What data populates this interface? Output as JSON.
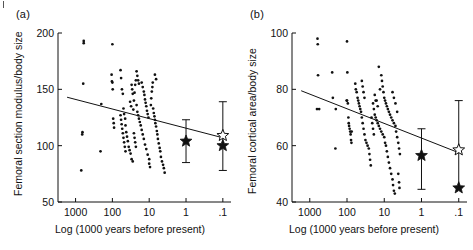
{
  "figure": {
    "corner_mark": "crop-tick-mark",
    "background": "#ffffff",
    "ink": "#111111"
  },
  "chart_data": [
    {
      "panel": "(a)",
      "type": "scatter",
      "title": "",
      "xlabel": "Log (1000 years before present)",
      "ylabel": "Femoral section modulus/body size",
      "x_scale": "log-reversed",
      "x_ticklabels": [
        "1000",
        "100",
        "10",
        "1",
        ".1"
      ],
      "x_tickvalues": [
        1000,
        100,
        10,
        1,
        0.1
      ],
      "xlim": [
        3000,
        0.06
      ],
      "y_ticklabels": [
        "50",
        "100",
        "150",
        "200"
      ],
      "y_tickvalues": [
        50,
        100,
        150,
        200
      ],
      "ylim": [
        50,
        200
      ],
      "grid": false,
      "legend": "none",
      "regression_line": {
        "x_start": 1700,
        "y_start": 143,
        "x_end": 0.1,
        "y_end": 107
      },
      "points": [
        [
          600,
          193
        ],
        [
          600,
          191
        ],
        [
          620,
          155
        ],
        [
          650,
          112
        ],
        [
          660,
          110
        ],
        [
          700,
          78
        ],
        [
          200,
          137
        ],
        [
          210,
          95
        ],
        [
          100,
          190
        ],
        [
          105,
          163
        ],
        [
          103,
          157
        ],
        [
          100,
          156
        ],
        [
          98,
          150
        ],
        [
          95,
          124
        ],
        [
          92,
          120
        ],
        [
          90,
          116
        ],
        [
          60,
          167
        ],
        [
          58,
          160
        ],
        [
          55,
          150
        ],
        [
          52,
          146
        ],
        [
          50,
          133
        ],
        [
          48,
          128
        ],
        [
          45,
          124
        ],
        [
          44,
          118
        ],
        [
          42,
          112
        ],
        [
          40,
          108
        ],
        [
          38,
          104
        ],
        [
          36,
          99
        ],
        [
          34,
          96
        ],
        [
          32,
          93
        ],
        [
          30,
          88
        ],
        [
          28,
          86
        ],
        [
          27,
          132
        ],
        [
          26,
          140
        ],
        [
          25,
          147
        ],
        [
          24,
          154
        ],
        [
          23,
          158
        ],
        [
          22,
          136
        ],
        [
          21,
          130
        ],
        [
          20,
          127
        ],
        [
          19,
          124
        ],
        [
          18,
          121
        ],
        [
          17,
          118
        ],
        [
          16,
          114
        ],
        [
          15,
          110
        ],
        [
          14,
          106
        ],
        [
          13,
          101
        ],
        [
          12,
          97
        ],
        [
          11,
          92
        ],
        [
          10,
          88
        ],
        [
          10,
          84
        ],
        [
          9.5,
          81
        ],
        [
          9,
          136
        ],
        [
          8.8,
          142
        ],
        [
          8.5,
          148
        ],
        [
          8.2,
          152
        ],
        [
          8,
          156
        ],
        [
          7.8,
          133
        ],
        [
          7.5,
          129
        ],
        [
          7.2,
          126
        ],
        [
          7,
          123
        ],
        [
          6.8,
          120
        ],
        [
          6.5,
          117
        ],
        [
          6.2,
          113
        ],
        [
          6,
          110
        ],
        [
          5.8,
          106
        ],
        [
          5.5,
          102
        ],
        [
          5.2,
          98
        ],
        [
          5,
          95
        ],
        [
          4.8,
          90
        ],
        [
          4.5,
          86
        ],
        [
          4.2,
          83
        ],
        [
          4,
          80
        ],
        [
          3.8,
          76
        ],
        [
          16,
          156
        ],
        [
          15,
          152
        ],
        [
          14,
          148
        ],
        [
          13.5,
          145
        ],
        [
          13,
          141
        ],
        [
          12.5,
          138
        ],
        [
          12,
          135
        ],
        [
          11.5,
          131
        ],
        [
          11,
          128
        ],
        [
          10.5,
          125
        ],
        [
          22,
          166
        ],
        [
          21,
          162
        ],
        [
          20,
          158
        ],
        [
          19,
          155
        ],
        [
          30,
          154
        ],
        [
          29,
          150
        ],
        [
          28,
          146
        ],
        [
          60,
          127
        ],
        [
          58,
          123
        ],
        [
          56,
          119
        ],
        [
          54,
          115
        ],
        [
          52,
          111
        ],
        [
          50,
          107
        ],
        [
          48,
          103
        ],
        [
          46,
          99
        ],
        [
          44,
          95
        ],
        [
          33,
          139
        ],
        [
          31,
          135
        ],
        [
          26,
          111
        ],
        [
          25,
          107
        ],
        [
          24,
          103
        ],
        [
          23,
          99
        ],
        [
          7,
          163
        ],
        [
          6.5,
          159
        ]
      ],
      "starred_points": [
        {
          "x": 1,
          "y": 104,
          "style": "filled-star",
          "err_low": 85,
          "err_high": 123
        },
        {
          "x": 0.1,
          "y": 109,
          "style": "open-star",
          "err_low": 78,
          "err_high": 139
        },
        {
          "x": 0.1,
          "y": 100,
          "style": "filled-star",
          "err_low": null,
          "err_high": null
        }
      ]
    },
    {
      "panel": "(b)",
      "type": "scatter",
      "title": "",
      "xlabel": "Log (1000 years before present)",
      "ylabel": "Femoral cortical area/body size",
      "x_scale": "log-reversed",
      "x_ticklabels": [
        "1000",
        "100",
        "10",
        "1",
        ".1"
      ],
      "x_tickvalues": [
        1000,
        100,
        10,
        1,
        0.1
      ],
      "xlim": [
        3000,
        0.06
      ],
      "y_ticklabels": [
        "40",
        "60",
        "80",
        "100"
      ],
      "y_tickvalues": [
        40,
        60,
        80,
        100
      ],
      "ylim": [
        40,
        100
      ],
      "grid": false,
      "legend": "none",
      "regression_line": {
        "x_start": 1700,
        "y_start": 79.5,
        "x_end": 0.1,
        "y_end": 57.5
      },
      "points": [
        [
          620,
          98
        ],
        [
          610,
          96
        ],
        [
          600,
          85
        ],
        [
          640,
          73
        ],
        [
          560,
          73
        ],
        [
          200,
          73
        ],
        [
          205,
          59
        ],
        [
          100,
          97
        ],
        [
          98,
          86
        ],
        [
          250,
          86
        ],
        [
          240,
          77
        ],
        [
          102,
          76
        ],
        [
          100,
          76
        ],
        [
          95,
          75
        ],
        [
          92,
          70
        ],
        [
          90,
          68
        ],
        [
          88,
          67
        ],
        [
          85,
          66
        ],
        [
          82,
          65
        ],
        [
          80,
          64
        ],
        [
          78,
          62
        ],
        [
          76,
          61
        ],
        [
          75,
          65
        ],
        [
          60,
          82
        ],
        [
          58,
          80
        ],
        [
          55,
          79
        ],
        [
          52,
          77
        ],
        [
          50,
          76
        ],
        [
          48,
          75
        ],
        [
          46,
          74
        ],
        [
          44,
          73
        ],
        [
          42,
          72
        ],
        [
          40,
          70
        ],
        [
          38,
          68
        ],
        [
          36,
          66
        ],
        [
          34,
          64
        ],
        [
          32,
          62
        ],
        [
          30,
          61
        ],
        [
          28,
          60
        ],
        [
          26,
          59
        ],
        [
          25,
          57
        ],
        [
          24,
          55
        ],
        [
          23,
          53
        ],
        [
          40,
          83
        ],
        [
          38,
          81
        ],
        [
          36,
          79
        ],
        [
          34,
          77
        ],
        [
          20,
          75
        ],
        [
          19,
          73
        ],
        [
          18,
          71
        ],
        [
          17,
          70
        ],
        [
          16,
          69
        ],
        [
          15,
          68
        ],
        [
          14,
          67
        ],
        [
          13,
          66
        ],
        [
          12,
          65
        ],
        [
          11,
          64
        ],
        [
          10,
          63
        ],
        [
          9.5,
          61
        ],
        [
          9,
          60
        ],
        [
          8.5,
          58
        ],
        [
          8,
          56
        ],
        [
          7.5,
          54
        ],
        [
          7,
          52
        ],
        [
          6.5,
          50
        ],
        [
          6,
          48
        ],
        [
          5.8,
          46
        ],
        [
          5.5,
          44
        ],
        [
          5.2,
          43
        ],
        [
          12,
          85
        ],
        [
          11.5,
          83
        ],
        [
          11,
          81
        ],
        [
          10.5,
          79
        ],
        [
          10,
          77
        ],
        [
          9.5,
          76
        ],
        [
          9,
          75
        ],
        [
          8.5,
          74
        ],
        [
          8,
          73
        ],
        [
          7.5,
          72
        ],
        [
          7,
          71
        ],
        [
          6.5,
          70
        ],
        [
          6,
          69
        ],
        [
          5.5,
          68
        ],
        [
          5,
          67
        ],
        [
          4.8,
          65
        ],
        [
          4.5,
          63
        ],
        [
          4.2,
          61
        ],
        [
          4,
          59
        ],
        [
          3.8,
          57
        ],
        [
          14,
          88
        ],
        [
          13,
          80
        ],
        [
          16,
          76
        ],
        [
          15,
          74
        ],
        [
          18,
          78
        ],
        [
          17,
          76
        ],
        [
          22,
          70
        ],
        [
          21,
          68
        ],
        [
          20,
          66
        ],
        [
          19,
          64
        ],
        [
          6,
          79
        ],
        [
          5.5,
          77
        ],
        [
          5,
          75
        ],
        [
          4.5,
          72
        ],
        [
          4.2,
          50
        ],
        [
          4,
          47
        ],
        [
          3.9,
          45
        ]
      ],
      "starred_points": [
        {
          "x": 1,
          "y": 56.5,
          "style": "filled-star",
          "err_low": 44.5,
          "err_high": 66
        },
        {
          "x": 0.1,
          "y": 58.5,
          "style": "open-star",
          "err_low": 45,
          "err_high": 76
        },
        {
          "x": 0.1,
          "y": 45,
          "style": "filled-star",
          "err_low": null,
          "err_high": null
        }
      ]
    }
  ]
}
